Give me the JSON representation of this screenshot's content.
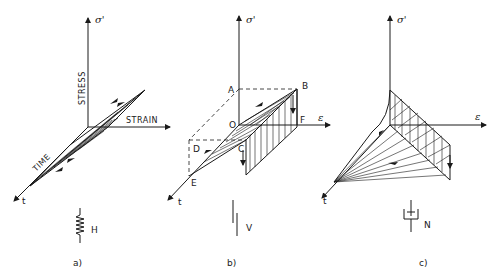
{
  "figure": {
    "panels": [
      {
        "id": "a",
        "caption": "a)",
        "axes": {
          "stress": "σ'",
          "stress_word": "STRESS",
          "strain": "STRAIN",
          "strain_symbol": "ε",
          "time_word": "TIME",
          "time": "t"
        },
        "element_symbol": "spring",
        "element_label": "H"
      },
      {
        "id": "b",
        "caption": "b)",
        "axes": {
          "stress": "σ'",
          "strain_symbol": "ε",
          "time": "t"
        },
        "points": [
          "A",
          "B",
          "O",
          "F",
          "D",
          "C",
          "E"
        ],
        "element_symbol": "plastic-slider",
        "element_label": "V"
      },
      {
        "id": "c",
        "caption": "c)",
        "axes": {
          "stress": "σ'",
          "strain_symbol": "ε",
          "time": "t"
        },
        "element_symbol": "dashpot",
        "element_label": "N"
      }
    ]
  }
}
